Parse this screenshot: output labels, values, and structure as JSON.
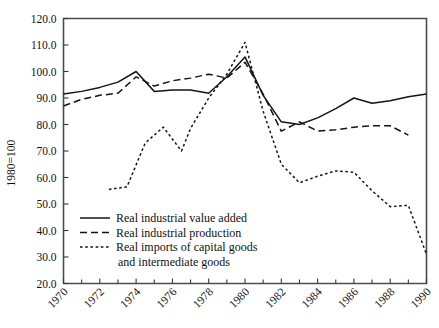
{
  "chart_data": {
    "type": "line",
    "title": "",
    "xlabel": "",
    "ylabel": "1980=100",
    "xlim": [
      1970,
      1990
    ],
    "ylim": [
      20.0,
      120.0
    ],
    "grid": false,
    "legend_position": "inside-lower-left",
    "x_tick_labels": [
      "1970",
      "1972",
      "1974",
      "1976",
      "1978",
      "1980",
      "1982",
      "1984",
      "1986",
      "1988",
      "1990"
    ],
    "x_tick_values": [
      1970,
      1972,
      1974,
      1976,
      1978,
      1980,
      1982,
      1984,
      1986,
      1988,
      1990
    ],
    "x_minor_ticks": [
      1971,
      1973,
      1975,
      1977,
      1979,
      1981,
      1983,
      1985,
      1987,
      1989
    ],
    "y_tick_labels": [
      "20.0",
      "30.0",
      "40.0",
      "50.0",
      "60.0",
      "70.0",
      "80.0",
      "90.0",
      "100.0",
      "110.0",
      "120.0"
    ],
    "y_tick_values": [
      20.0,
      30.0,
      40.0,
      50.0,
      60.0,
      70.0,
      80.0,
      90.0,
      100.0,
      110.0,
      120.0
    ],
    "series": [
      {
        "name": "Real industrial value added",
        "style": "solid",
        "color": "#141414",
        "x": [
          1970,
          1971,
          1972,
          1973,
          1974,
          1975,
          1976,
          1977,
          1978,
          1979,
          1980,
          1981,
          1982,
          1983,
          1984,
          1985,
          1986,
          1987,
          1988,
          1989,
          1990
        ],
        "values": [
          91.5,
          92.5,
          94.0,
          96.0,
          100.0,
          92.5,
          93.0,
          93.0,
          91.8,
          98.0,
          105.5,
          91.0,
          81.0,
          80.0,
          82.5,
          86.0,
          90.0,
          88.0,
          89.0,
          90.5,
          91.5
        ]
      },
      {
        "name": "Real industrial production",
        "style": "dashed",
        "color": "#141414",
        "x": [
          1970,
          1971,
          1972,
          1973,
          1974,
          1975,
          1976,
          1977,
          1978,
          1979,
          1980,
          1981,
          1982,
          1983,
          1984,
          1985,
          1986,
          1987,
          1988,
          1989
        ],
        "values": [
          87.0,
          89.5,
          91.0,
          91.8,
          98.0,
          94.5,
          96.5,
          97.5,
          99.0,
          97.5,
          103.5,
          91.5,
          77.5,
          81.0,
          77.5,
          78.0,
          79.0,
          79.5,
          79.5,
          76.0
        ]
      },
      {
        "name": "Real imports of capital goods and intermediate goods",
        "style": "dotted",
        "color": "#141414",
        "x": [
          1972.5,
          1973.5,
          1974.5,
          1975.5,
          1976.5,
          1977,
          1978,
          1979,
          1980,
          1981,
          1982,
          1983,
          1984,
          1985,
          1986,
          1987,
          1988,
          1989,
          1990
        ],
        "values": [
          55.5,
          56.5,
          73.0,
          79.0,
          70.0,
          78.5,
          90.0,
          99.0,
          111.0,
          85.0,
          65.0,
          58.0,
          60.5,
          62.5,
          62.0,
          55.0,
          49.0,
          49.5,
          31.0
        ]
      }
    ]
  },
  "legend": {
    "items": [
      {
        "label": "Real industrial value added",
        "style": "solid"
      },
      {
        "label": "Real industrial production",
        "style": "dashed"
      },
      {
        "label": "Real imports of capital goods",
        "style": "dotted"
      },
      {
        "label": "and intermediate goods",
        "style": "none"
      }
    ]
  }
}
